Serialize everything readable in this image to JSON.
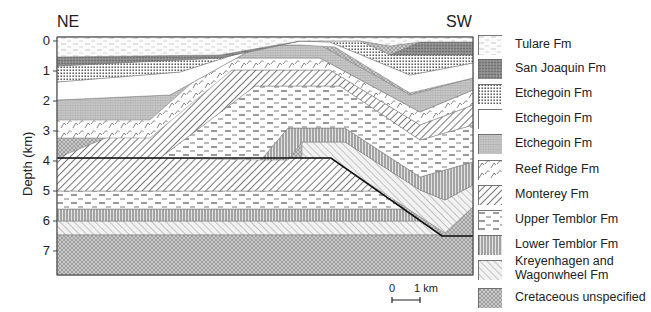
{
  "figure": {
    "left_direction": "NE",
    "right_direction": "SW",
    "y_axis": {
      "title": "Depth (km)",
      "ticks": [
        "0",
        "1",
        "2",
        "3",
        "4",
        "5",
        "6",
        "7"
      ]
    },
    "scale_bar": {
      "start_label": "0",
      "end_label": "1 km"
    }
  },
  "legend": {
    "items": [
      {
        "label": "Tulare Fm",
        "pattern": "tulare"
      },
      {
        "label": "San Joaquin Fm",
        "pattern": "sanjoaquin"
      },
      {
        "label": "Etchegoin Fm",
        "pattern": "etch_dots"
      },
      {
        "label": "Etchegoin Fm",
        "pattern": "etch_white"
      },
      {
        "label": "Etchegoin Fm",
        "pattern": "etch_grid"
      },
      {
        "label": "Reef Ridge Fm",
        "pattern": "reef"
      },
      {
        "label": "Monterey Fm",
        "pattern": "monterey"
      },
      {
        "label": "Upper Temblor Fm",
        "pattern": "utemblor"
      },
      {
        "label": "Lower Temblor Fm",
        "pattern": "ltemblor"
      },
      {
        "label": "Kreyenhagen and",
        "label2": "Wagonwheel Fm",
        "pattern": "kreyen"
      },
      {
        "label": "Cretaceous unspecified",
        "pattern": "cret"
      }
    ]
  },
  "chart_data": {
    "type": "cross-section",
    "title": "",
    "ylabel": "Depth (km)",
    "ylim": [
      0,
      7.8
    ],
    "orientation": {
      "left": "NE",
      "right": "SW"
    },
    "scale": "0 - 1 km",
    "units_from_top": [
      "Tulare Fm",
      "San Joaquin Fm",
      "Etchegoin Fm (dotted)",
      "Etchegoin Fm (white)",
      "Etchegoin Fm (grid)",
      "Reef Ridge Fm",
      "Monterey Fm",
      "Upper Temblor Fm",
      "Lower Temblor Fm",
      "Kreyenhagen and Wagonwheel Fm",
      "Cretaceous unspecified"
    ],
    "ne_flank_depths_km": {
      "Tulare Fm": [
        0,
        0.6
      ],
      "San Joaquin Fm": [
        0.6,
        1.6
      ],
      "Etchegoin Fm (dotted)": [
        1.6,
        2.0
      ],
      "Etchegoin Fm (white)": [
        2.0,
        2.6
      ],
      "Etchegoin Fm (grid)": [
        2.6,
        3.4
      ],
      "Reef Ridge Fm": [
        3.4,
        3.9
      ],
      "Monterey Fm": [
        3.9,
        5.0
      ],
      "Upper Temblor Fm": [
        5.0,
        5.7
      ],
      "Lower Temblor Fm": [
        5.7,
        6.1
      ],
      "Kreyenhagen and Wagonwheel Fm": [
        6.1,
        6.5
      ],
      "Cretaceous unspecified": [
        6.5,
        7.8
      ]
    },
    "fault": "thrust fault dipping SW from ~3.9 km (NE) to ~6.5 km (SW)"
  }
}
